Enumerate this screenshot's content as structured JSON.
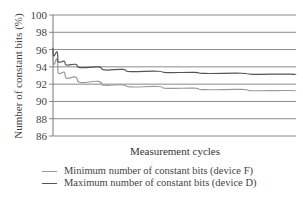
{
  "chart_data": {
    "type": "line",
    "title": "",
    "xlabel": "Measurement cycles",
    "ylabel": "Number of constant bits (%)",
    "ylim": [
      86,
      100
    ],
    "yticks": [
      100,
      98,
      96,
      94,
      92,
      90,
      88,
      86
    ],
    "grid": true,
    "legend_position": "bottom",
    "x": [
      0,
      0.02,
      0.05,
      0.1,
      0.2,
      0.3,
      0.45,
      0.6,
      0.8,
      1.0
    ],
    "series": [
      {
        "name": "Minimum number of constant bits (device F)",
        "color": "#9a9a9a",
        "values": [
          95.6,
          93.6,
          93.0,
          92.5,
          92.0,
          91.8,
          91.6,
          91.45,
          91.3,
          91.2
        ]
      },
      {
        "name": "Maximum number of constant bits (device D)",
        "color": "#555555",
        "values": [
          96.2,
          94.8,
          94.4,
          94.1,
          93.8,
          93.55,
          93.4,
          93.3,
          93.2,
          93.1
        ]
      }
    ]
  },
  "labels": {
    "ylabel": "Number of constant bits (%)",
    "xlabel": "Measurement cycles",
    "legend": [
      "Minimum number of constant bits (device F)",
      "Maximum number of constant bits (device D)"
    ]
  },
  "ticks": [
    "100",
    "98",
    "96",
    "94",
    "92",
    "90",
    "88",
    "86"
  ]
}
